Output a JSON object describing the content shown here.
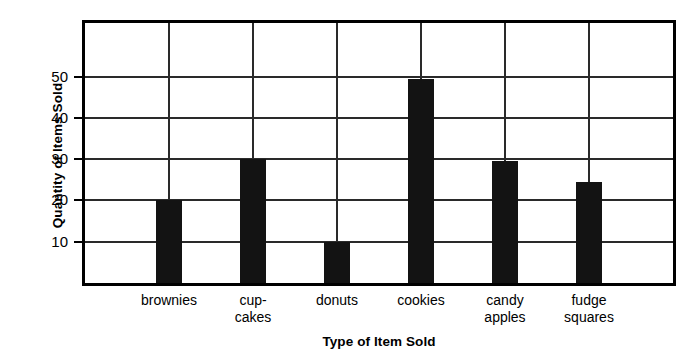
{
  "chart_data": {
    "type": "bar",
    "title": "",
    "xlabel": "Type of Item Sold",
    "ylabel": "Quantity of Items Sold",
    "categories": [
      "brownies",
      "cup-\ncakes",
      "donuts",
      "cookies",
      "candy\napples",
      "fudge\nsquares"
    ],
    "values": [
      20,
      30,
      10,
      49.5,
      29.5,
      24.5
    ],
    "ylim": [
      0,
      63
    ],
    "yticks": [
      10,
      20,
      30,
      40,
      50
    ],
    "ytick_labels": [
      "10",
      "20",
      "30",
      "40",
      "50"
    ],
    "grid": "horizontal-and-vertical",
    "legend": "none",
    "bar_color": "#131313",
    "axis_color": "#000000",
    "grid_color": "#2a2a2a",
    "background": "#ffffff"
  },
  "axes": {
    "y_title": "Quantity of Items Sold",
    "x_title": "Type of Item Sold",
    "y_ticks": [
      {
        "label": "50",
        "value": 50
      },
      {
        "label": "40",
        "value": 40
      },
      {
        "label": "30",
        "value": 30
      },
      {
        "label": "20",
        "value": 20
      },
      {
        "label": "10",
        "value": 10
      }
    ]
  },
  "bars": [
    {
      "label": "brownies",
      "label_lines": "brownies",
      "value": 20
    },
    {
      "label": "cupcakes",
      "label_lines": "cup-\ncakes",
      "value": 30
    },
    {
      "label": "donuts",
      "label_lines": "donuts",
      "value": 10
    },
    {
      "label": "cookies",
      "label_lines": "cookies",
      "value": 49.5
    },
    {
      "label": "candy apples",
      "label_lines": "candy\napples",
      "value": 29.5
    },
    {
      "label": "fudge squares",
      "label_lines": "fudge\nsquares",
      "value": 24.5
    }
  ]
}
